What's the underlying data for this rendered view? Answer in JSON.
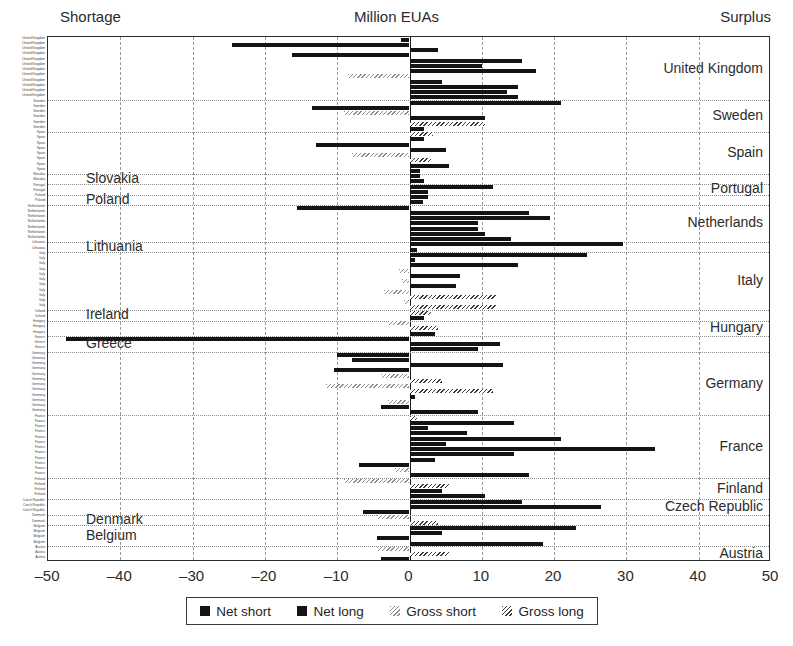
{
  "header": {
    "left_label": "Shortage",
    "title": "Million EUAs",
    "right_label": "Surplus"
  },
  "legend": {
    "items": [
      {
        "label": "Net short",
        "swatch": "net"
      },
      {
        "label": "Net long",
        "swatch": "net"
      },
      {
        "label": "Gross short",
        "swatch": "gs"
      },
      {
        "label": "Gross long",
        "swatch": "gl"
      }
    ]
  },
  "chart_data": {
    "type": "bar",
    "orientation": "horizontal",
    "title": "Million EUAs",
    "xlabel": "Million EUAs",
    "ylabel": "",
    "xlim": [
      -50,
      50
    ],
    "xticks": [
      -50,
      -40,
      -30,
      -20,
      -10,
      0,
      10,
      20,
      30,
      40,
      50
    ],
    "xticklabels": [
      "–50",
      "–40",
      "–30",
      "–20",
      "–10",
      "0",
      "10",
      "20",
      "30",
      "40",
      "50"
    ],
    "grid": "vertical-dashed",
    "legend_position": "below-axis",
    "annotations": {
      "left": "Shortage",
      "right": "Surplus"
    },
    "series_names": [
      "Net short",
      "Net long",
      "Gross short",
      "Gross long"
    ],
    "groups": [
      {
        "country": "United Kingdom",
        "side": "right",
        "bars": [
          {
            "series": "Net short",
            "value": -1.2
          },
          {
            "series": "Net short",
            "value": -24.5
          },
          {
            "series": "Net long",
            "value": 4.0
          },
          {
            "series": "Net short",
            "value": -16.2
          },
          {
            "series": "Net long",
            "value": 15.5
          },
          {
            "series": "Net long",
            "value": 10.0
          },
          {
            "series": "Net long",
            "value": 17.5
          },
          {
            "series": "Gross short",
            "value": -8.5
          },
          {
            "series": "Net long",
            "value": 4.5
          },
          {
            "series": "Net long",
            "value": 15.0
          },
          {
            "series": "Net long",
            "value": 13.5
          },
          {
            "series": "Net long",
            "value": 15.0
          }
        ]
      },
      {
        "country": "Sweden",
        "side": "right",
        "bars": [
          {
            "series": "Net long",
            "value": 21.0
          },
          {
            "series": "Net short",
            "value": -13.5
          },
          {
            "series": "Gross short",
            "value": -9.0
          },
          {
            "series": "Net long",
            "value": 10.5
          },
          {
            "series": "Gross long",
            "value": 10.5
          },
          {
            "series": "Net long",
            "value": 2.0
          }
        ]
      },
      {
        "country": "Spain",
        "side": "right",
        "bars": [
          {
            "series": "Gross long",
            "value": 3.2
          },
          {
            "series": "Net long",
            "value": 2.0
          },
          {
            "series": "Net short",
            "value": -13.0
          },
          {
            "series": "Net long",
            "value": 5.0
          },
          {
            "series": "Gross short",
            "value": -8.0
          },
          {
            "series": "Gross long",
            "value": 3.0
          },
          {
            "series": "Net long",
            "value": 5.5
          },
          {
            "series": "Net long",
            "value": 1.5
          }
        ]
      },
      {
        "country": "Slovakia",
        "side": "left",
        "bars": [
          {
            "series": "Net long",
            "value": 1.5
          },
          {
            "series": "Net long",
            "value": 2.0
          }
        ]
      },
      {
        "country": "Portugal",
        "side": "right",
        "bars": [
          {
            "series": "Net long",
            "value": 11.5
          },
          {
            "series": "Net long",
            "value": 2.5
          }
        ]
      },
      {
        "country": "Poland",
        "side": "left",
        "bars": [
          {
            "series": "Net long",
            "value": 2.5
          },
          {
            "series": "Net long",
            "value": 1.8
          }
        ]
      },
      {
        "country": "Netherlands",
        "side": "right",
        "bars": [
          {
            "series": "Net short",
            "value": -15.5
          },
          {
            "series": "Net long",
            "value": 16.5
          },
          {
            "series": "Net long",
            "value": 19.5
          },
          {
            "series": "Net long",
            "value": 9.5
          },
          {
            "series": "Net long",
            "value": 9.5
          },
          {
            "series": "Net long",
            "value": 10.5
          },
          {
            "series": "Net long",
            "value": 14.0
          }
        ]
      },
      {
        "country": "Lithuania",
        "side": "left",
        "bars": [
          {
            "series": "Net long",
            "value": 29.5
          },
          {
            "series": "Net long",
            "value": 1.0
          }
        ]
      },
      {
        "country": "Italy",
        "side": "right",
        "bars": [
          {
            "series": "Net long",
            "value": 24.5
          },
          {
            "series": "Net long",
            "value": 0.8
          },
          {
            "series": "Net long",
            "value": 15.0
          },
          {
            "series": "Gross short",
            "value": -1.5
          },
          {
            "series": "Net long",
            "value": 7.0
          },
          {
            "series": "Gross short",
            "value": -1.0
          },
          {
            "series": "Net long",
            "value": 6.5
          },
          {
            "series": "Gross short",
            "value": -3.5
          },
          {
            "series": "Gross long",
            "value": 12.0
          },
          {
            "series": "Gross short",
            "value": -0.8
          },
          {
            "series": "Gross long",
            "value": 12.0
          }
        ]
      },
      {
        "country": "Ireland",
        "side": "left",
        "bars": [
          {
            "series": "Gross long",
            "value": 3.0
          },
          {
            "series": "Net long",
            "value": 2.0
          }
        ]
      },
      {
        "country": "Hungary",
        "side": "right",
        "bars": [
          {
            "series": "Gross short",
            "value": -3.0
          },
          {
            "series": "Gross long",
            "value": 4.0
          },
          {
            "series": "Net long",
            "value": 3.5
          }
        ]
      },
      {
        "country": "Greece",
        "side": "left",
        "bars": [
          {
            "series": "Net short",
            "value": -47.5
          },
          {
            "series": "Net long",
            "value": 12.5
          },
          {
            "series": "Net long",
            "value": 9.5
          }
        ]
      },
      {
        "country": "Germany",
        "side": "right",
        "bars": [
          {
            "series": "Net short",
            "value": -10.0
          },
          {
            "series": "Net short",
            "value": -8.0
          },
          {
            "series": "Net long",
            "value": 13.0
          },
          {
            "series": "Net short",
            "value": -10.5
          },
          {
            "series": "Gross short",
            "value": -4.0
          },
          {
            "series": "Gross long",
            "value": 4.5
          },
          {
            "series": "Gross short",
            "value": -11.5
          },
          {
            "series": "Gross long",
            "value": 11.5
          },
          {
            "series": "Net long",
            "value": 0.8
          },
          {
            "series": "Gross short",
            "value": -3.0
          },
          {
            "series": "Net short",
            "value": -4.0
          },
          {
            "series": "Net long",
            "value": 9.5
          }
        ]
      },
      {
        "country": "France",
        "side": "right",
        "bars": [
          {
            "series": "Gross long",
            "value": 1.0
          },
          {
            "series": "Net long",
            "value": 14.5
          },
          {
            "series": "Net long",
            "value": 2.5
          },
          {
            "series": "Net long",
            "value": 8.0
          },
          {
            "series": "Net long",
            "value": 21.0
          },
          {
            "series": "Net long",
            "value": 5.0
          },
          {
            "series": "Net long",
            "value": 34.0
          },
          {
            "series": "Net long",
            "value": 14.5
          },
          {
            "series": "Net long",
            "value": 3.5
          },
          {
            "series": "Net short",
            "value": -7.0
          },
          {
            "series": "Gross short",
            "value": -2.0
          },
          {
            "series": "Net long",
            "value": 16.5
          }
        ]
      },
      {
        "country": "Finland",
        "side": "right",
        "bars": [
          {
            "series": "Gross short",
            "value": -9.0
          },
          {
            "series": "Gross long",
            "value": 5.5
          },
          {
            "series": "Net long",
            "value": 4.5
          },
          {
            "series": "Net long",
            "value": 10.5
          }
        ]
      },
      {
        "country": "Czech Republic",
        "side": "right",
        "bars": [
          {
            "series": "Net long",
            "value": 15.5
          },
          {
            "series": "Net long",
            "value": 26.5
          },
          {
            "series": "Net short",
            "value": -6.5
          }
        ]
      },
      {
        "country": "Denmark",
        "side": "left",
        "bars": [
          {
            "series": "Gross short",
            "value": -4.5
          },
          {
            "series": "Gross long",
            "value": 4.0
          }
        ]
      },
      {
        "country": "Belgium",
        "side": "left",
        "bars": [
          {
            "series": "Net long",
            "value": 23.0
          },
          {
            "series": "Net long",
            "value": 4.5
          },
          {
            "series": "Net short",
            "value": -4.5
          },
          {
            "series": "Net long",
            "value": 18.5
          }
        ]
      },
      {
        "country": "Austria",
        "side": "right",
        "bars": [
          {
            "series": "Gross short",
            "value": -4.5
          },
          {
            "series": "Gross long",
            "value": 5.5
          },
          {
            "series": "Net short",
            "value": -4.0
          }
        ]
      }
    ]
  }
}
